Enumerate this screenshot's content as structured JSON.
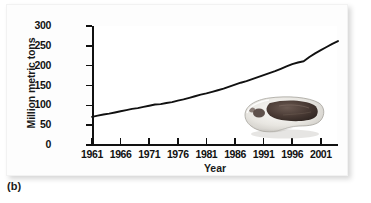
{
  "figure": {
    "caption": "(b)",
    "inset_photo_alt": "meat-cut-photo"
  },
  "chart_data": {
    "type": "line",
    "title": "",
    "xlabel": "Year",
    "ylabel": "Million metric tons",
    "xlim": [
      1961,
      2004
    ],
    "ylim": [
      0,
      300
    ],
    "grid": false,
    "legend": false,
    "x_tick_labels": [
      "1961",
      "1966",
      "1971",
      "1976",
      "1981",
      "1986",
      "1991",
      "1996",
      "2001"
    ],
    "x_ticks": [
      1961,
      1966,
      1971,
      1976,
      1981,
      1986,
      1991,
      1996,
      2001
    ],
    "y_tick_labels": [
      "0",
      "50",
      "100",
      "150",
      "200",
      "250",
      "300"
    ],
    "y_ticks": [
      0,
      50,
      100,
      150,
      200,
      250,
      300
    ],
    "line_color": "#111111",
    "series": [
      {
        "name": "World meat production",
        "x": [
          1961,
          1962,
          1963,
          1964,
          1965,
          1966,
          1967,
          1968,
          1969,
          1970,
          1971,
          1972,
          1973,
          1974,
          1975,
          1976,
          1977,
          1978,
          1979,
          1980,
          1981,
          1982,
          1983,
          1984,
          1985,
          1986,
          1987,
          1988,
          1989,
          1990,
          1991,
          1992,
          1993,
          1994,
          1995,
          1996,
          1997,
          1998,
          1999,
          2000,
          2001,
          2002,
          2003,
          2004
        ],
        "values": [
          71,
          74,
          77,
          79,
          82,
          85,
          88,
          91,
          93,
          96,
          99,
          102,
          103,
          106,
          108,
          112,
          115,
          119,
          123,
          127,
          130,
          134,
          138,
          142,
          147,
          152,
          157,
          161,
          166,
          171,
          176,
          181,
          186,
          192,
          198,
          204,
          208,
          211,
          222,
          231,
          239,
          247,
          255,
          262
        ]
      }
    ]
  }
}
